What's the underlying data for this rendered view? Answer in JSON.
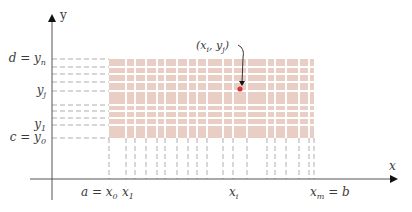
{
  "diagram": {
    "axes": {
      "x_label": "x",
      "y_label": "y",
      "origin_px": [
        52,
        179
      ],
      "x_axis_end_px": 398,
      "y_axis_top_px": 14
    },
    "grid": {
      "fill_color": "#e9cec6",
      "line_color": "#ffffff",
      "dash_color": "#9a9a9a",
      "left_px": 109,
      "right_px": 314,
      "top_px": 59,
      "bottom_px": 138,
      "x_lines_px": [
        109,
        126,
        135,
        146,
        157,
        165,
        177,
        188,
        197,
        207,
        223,
        233,
        247,
        267,
        275,
        286,
        299,
        309,
        314
      ],
      "y_lines_px": [
        59,
        67,
        74,
        82,
        91,
        105,
        111,
        118,
        125,
        138
      ]
    },
    "y_labels": [
      {
        "text": "d = y",
        "sub": "n",
        "y_px": 59
      },
      {
        "text": "y",
        "sub": "j",
        "y_px": 91
      },
      {
        "text": "y",
        "sub": "1",
        "y_px": 125
      },
      {
        "text": "c = y",
        "sub": "0",
        "y_px": 138
      }
    ],
    "x_labels": [
      {
        "text": "a = x",
        "sub": "0",
        "x_px": 109
      },
      {
        "text": "x",
        "sub": "1",
        "x_px": 126
      },
      {
        "text": "x",
        "sub": "i",
        "x_px": 233
      },
      {
        "text": "x",
        "sub": "m",
        "suffix": " = b",
        "x_px": 314
      }
    ],
    "point": {
      "label_open": "(x",
      "label_sub1": "i",
      "label_mid": ", y",
      "label_sub2": "j",
      "label_close": ")",
      "x_px": 233,
      "y_px": 89,
      "color": "#d9343c"
    }
  }
}
